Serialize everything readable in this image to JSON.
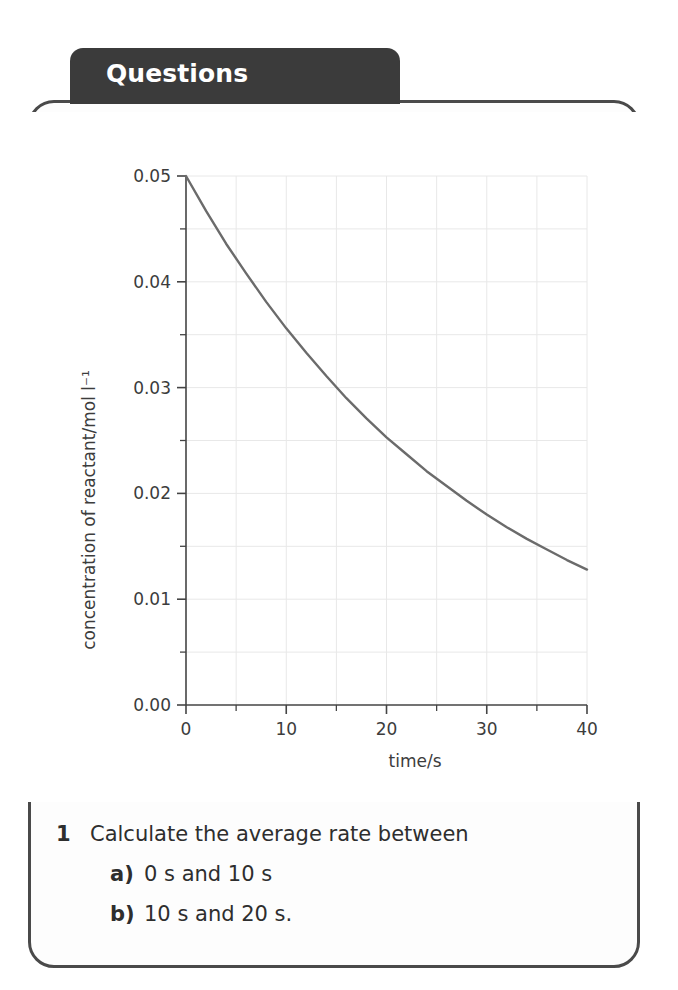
{
  "tab": {
    "label": "Questions"
  },
  "chart_data": {
    "type": "line",
    "title": "",
    "xlabel": "time/s",
    "ylabel": "concentration of reactant/mol l⁻¹",
    "xlim": [
      0,
      40
    ],
    "ylim": [
      0.0,
      0.05
    ],
    "grid": true,
    "legend": "none",
    "x_ticks": [
      0,
      10,
      20,
      30,
      40
    ],
    "x_tick_labels": [
      "0",
      "10",
      "20",
      "30",
      "40"
    ],
    "x_minor_ticks": [
      5,
      15,
      25,
      35
    ],
    "y_ticks": [
      0.0,
      0.01,
      0.02,
      0.03,
      0.04,
      0.05
    ],
    "y_tick_labels": [
      "0.00",
      "0.01",
      "0.02",
      "0.03",
      "0.04",
      "0.05"
    ],
    "y_minor_ticks": [
      0.005,
      0.015,
      0.025,
      0.035,
      0.045
    ],
    "series": [
      {
        "name": "concentration of reactant",
        "color": "#6b6b6b",
        "x": [
          0,
          2,
          4,
          6,
          8,
          10,
          12,
          14,
          16,
          18,
          20,
          22,
          24,
          26,
          28,
          30,
          32,
          34,
          36,
          38,
          40
        ],
        "y": [
          0.05,
          0.0467,
          0.0436,
          0.0408,
          0.0381,
          0.0356,
          0.0333,
          0.0311,
          0.029,
          0.0271,
          0.0253,
          0.0237,
          0.0221,
          0.0207,
          0.0193,
          0.018,
          0.0168,
          0.0157,
          0.0147,
          0.0137,
          0.0128
        ]
      }
    ]
  },
  "questions": [
    {
      "marker": "1",
      "sub": false,
      "text": "Calculate the average rate between"
    },
    {
      "marker": "a)",
      "sub": true,
      "text": "0 s and 10 s"
    },
    {
      "marker": "b)",
      "sub": true,
      "text": "10 s and 20 s."
    }
  ],
  "colors": {
    "tab_background": "#3b3b3b",
    "card_border": "#4a4a4a",
    "curve": "#6b6b6b",
    "grid": "#e8e8e8",
    "axis": "#444444",
    "text": "#2e2e2e"
  }
}
